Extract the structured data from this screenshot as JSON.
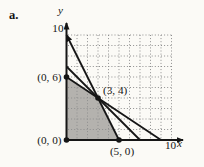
{
  "figure": {
    "item_label": "a."
  },
  "chart_data": {
    "type": "line",
    "title": "",
    "xlabel": "x",
    "ylabel": "y",
    "xlim": [
      0,
      10
    ],
    "ylim": [
      0,
      10
    ],
    "x_tick_labels": [
      "10"
    ],
    "y_tick_labels": [
      "10"
    ],
    "grid": {
      "show": true,
      "style": "dotted",
      "spacing": 1
    },
    "feasible_region": {
      "vertices": [
        [
          0,
          0
        ],
        [
          5,
          0
        ],
        [
          3,
          4
        ],
        [
          0,
          6
        ]
      ]
    },
    "lines": [
      {
        "from": [
          5,
          0
        ],
        "to": [
          0,
          10
        ],
        "x_intercept": 5,
        "y_intercept": 10,
        "arrow_end": true
      },
      {
        "from": [
          7,
          0
        ],
        "to": [
          0,
          7
        ],
        "x_intercept": 7,
        "y_intercept": 7,
        "arrow_end": false
      },
      {
        "from": [
          9,
          0
        ],
        "to": [
          0,
          6
        ],
        "x_intercept": 9,
        "y_intercept": 6,
        "arrow_end": false
      }
    ],
    "labeled_points": [
      {
        "label": "(0, 6)",
        "point": [
          0,
          6
        ],
        "placement": "left"
      },
      {
        "label": "(3, 4)",
        "point": [
          3,
          4
        ],
        "placement": "above-right"
      },
      {
        "label": "(0, 0)",
        "point": [
          0,
          0
        ],
        "placement": "left"
      },
      {
        "label": "(5, 0)",
        "point": [
          5,
          0
        ],
        "placement": "below"
      }
    ],
    "colors": {
      "shade": "#b4b2ae",
      "ink": "#151515",
      "grid": "#8f8f8f",
      "background": "#fbfaf6"
    }
  }
}
